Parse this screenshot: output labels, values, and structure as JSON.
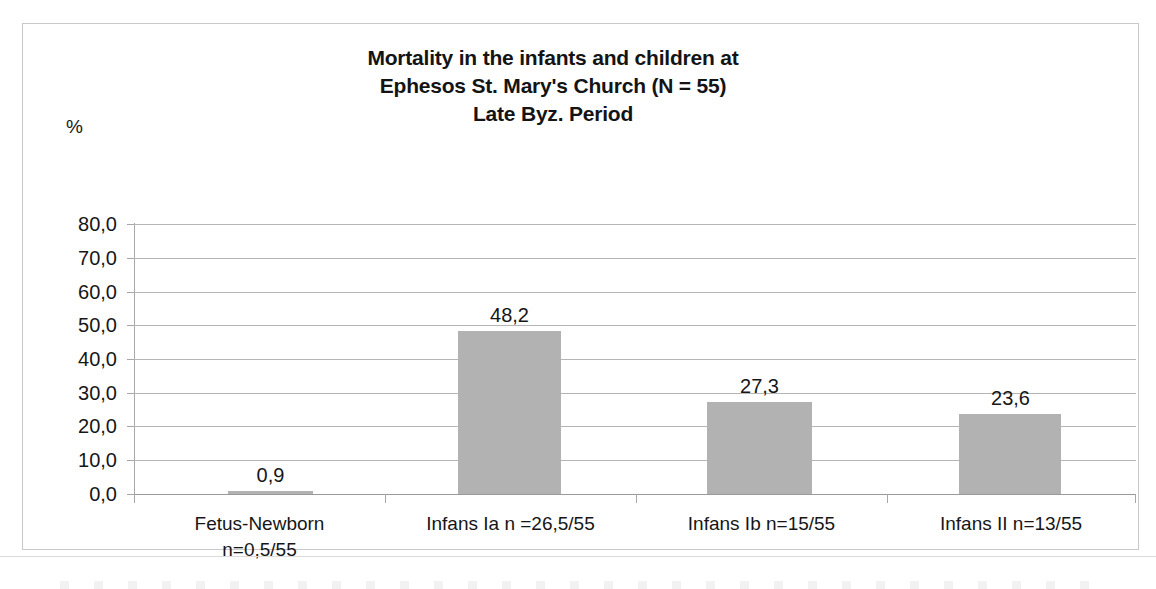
{
  "chart_data": {
    "type": "bar",
    "title": "Mortality in the infants and children at Ephesos St. Mary's Church (N = 55) Late Byz. Period",
    "title_lines": [
      "Mortality in the infants and children at",
      "Ephesos St. Mary's Church (N = 55)",
      "Late Byz. Period"
    ],
    "xlabel": "",
    "ylabel": "%",
    "ylim": [
      0,
      80
    ],
    "ytick_step": 10,
    "ytick_labels": [
      "80,0",
      "70,0",
      "60,0",
      "50,0",
      "40,0",
      "30,0",
      "20,0",
      "10,0",
      "0,0"
    ],
    "ytick_values": [
      80,
      70,
      60,
      50,
      40,
      30,
      20,
      10,
      0
    ],
    "grid": true,
    "legend": false,
    "decimal_separator": ",",
    "categories": [
      "Fetus-Newborn n=0,5/55",
      "Infans Ia n =26,5/55",
      "Infans Ib n=15/55",
      "Infans II n=13/55"
    ],
    "category_lines": [
      [
        "Fetus-Newborn",
        "n=0,5/55"
      ],
      [
        "Infans Ia n =26,5/55",
        ""
      ],
      [
        "Infans Ib n=15/55",
        ""
      ],
      [
        "Infans II n=13/55",
        ""
      ]
    ],
    "values": [
      0.9,
      48.2,
      27.3,
      23.6
    ],
    "data_labels": [
      "0,9",
      "48,2",
      "27,3",
      "23,6"
    ],
    "bar_color": "#b2b2b2",
    "grid_color": "#b5b5b5",
    "axis_color": "#a8a8a8",
    "text_color": "#161616",
    "background": "#ffffff",
    "border_color": "#c9c9c9"
  }
}
